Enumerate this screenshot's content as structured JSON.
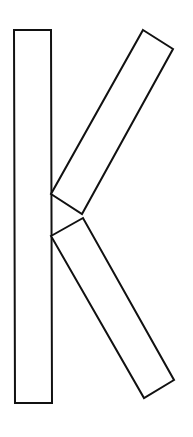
{
  "figure": {
    "width": 193,
    "height": 437,
    "background": "#ffffff",
    "stroke": "#111111",
    "stroke_width": 2,
    "fill": "#ffffff",
    "shapes": [
      {
        "name": "vertical-stem",
        "points": "14,30 51,30 52,403 15,403"
      },
      {
        "name": "upper-diagonal-arm",
        "points": "143,30 173,49 82,214 51,194"
      },
      {
        "name": "lower-diagonal-arm",
        "points": "51,236 83,218 174,380 144,398"
      }
    ]
  }
}
